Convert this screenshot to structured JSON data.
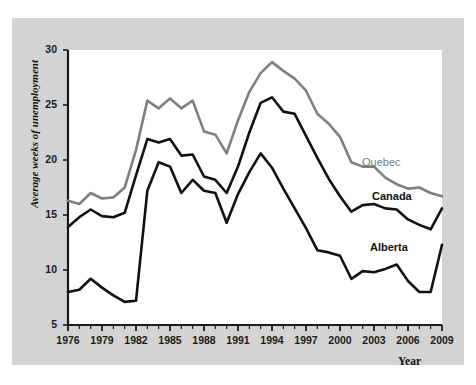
{
  "chart_data": {
    "type": "line",
    "title": "",
    "xlabel": "Year",
    "ylabel": "Average weeks of unemployment",
    "xlim": [
      1976,
      2009
    ],
    "ylim": [
      5,
      30
    ],
    "grid": false,
    "legend_position": "inline-right-of-lines",
    "x_tick_labels": [
      "1976",
      "1979",
      "1982",
      "1985",
      "1988",
      "1991",
      "1994",
      "1997",
      "2000",
      "2003",
      "2006",
      "2009"
    ],
    "y_tick_labels": [
      "5",
      "10",
      "15",
      "20",
      "25",
      "30"
    ],
    "x_tick_values": [
      1976,
      1979,
      1982,
      1985,
      1988,
      1991,
      1994,
      1997,
      2000,
      2003,
      2006,
      2009
    ],
    "y_tick_values": [
      5,
      10,
      15,
      20,
      25,
      30
    ],
    "x_minor_tick_step": 1,
    "x": [
      1976,
      1977,
      1978,
      1979,
      1980,
      1981,
      1982,
      1983,
      1984,
      1985,
      1986,
      1987,
      1988,
      1989,
      1990,
      1991,
      1992,
      1993,
      1994,
      1995,
      1996,
      1997,
      1998,
      1999,
      2000,
      2001,
      2002,
      2003,
      2004,
      2005,
      2006,
      2007,
      2008,
      2009
    ],
    "series": [
      {
        "name": "Quebec",
        "color": "#7f7f7f",
        "values": [
          16.3,
          16.0,
          17.0,
          16.5,
          16.6,
          17.5,
          20.9,
          25.4,
          24.7,
          25.6,
          24.7,
          25.4,
          22.6,
          22.3,
          20.6,
          23.6,
          26.2,
          27.9,
          28.9,
          28.1,
          27.4,
          26.3,
          24.2,
          23.3,
          22.1,
          19.8,
          19.4,
          19.4,
          18.4,
          17.8,
          17.4,
          17.5,
          17.0,
          16.7
        ]
      },
      {
        "name": "Canada",
        "color": "#111111",
        "values": [
          13.9,
          14.8,
          15.5,
          14.9,
          14.8,
          15.2,
          18.6,
          21.9,
          21.6,
          21.9,
          20.4,
          20.5,
          18.5,
          18.2,
          17.0,
          19.4,
          22.5,
          25.2,
          25.7,
          24.4,
          24.2,
          22.2,
          20.2,
          18.3,
          16.7,
          15.3,
          15.9,
          16.0,
          15.6,
          15.5,
          14.6,
          14.1,
          13.7,
          15.6
        ]
      },
      {
        "name": "Alberta",
        "color": "#111111",
        "values": [
          8.0,
          8.2,
          9.2,
          8.4,
          7.7,
          7.1,
          7.2,
          17.2,
          19.8,
          19.4,
          17.0,
          18.2,
          17.2,
          17.0,
          14.3,
          16.9,
          18.9,
          20.6,
          19.3,
          17.4,
          15.6,
          13.8,
          11.8,
          11.6,
          11.3,
          9.2,
          9.9,
          9.8,
          10.1,
          10.5,
          9.0,
          8.0,
          8.0,
          12.3
        ]
      }
    ]
  },
  "axes": {
    "y_title": "Average weeks of unemployment",
    "x_title": "Year"
  },
  "labels": {
    "quebec": "Quebec",
    "canada": "Canada",
    "alberta": "Alberta"
  }
}
